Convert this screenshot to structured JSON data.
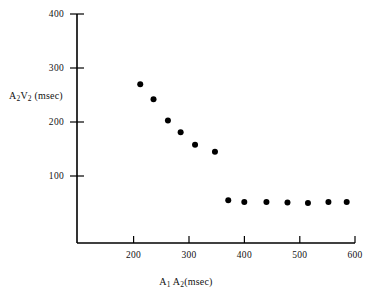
{
  "chart_data": {
    "type": "scatter",
    "title": "",
    "xlabel": "A1 A2(msec)",
    "ylabel": "A2V2 (msec)",
    "xlabel_parts": {
      "a": "A",
      "sub1": "1",
      "b": " A",
      "sub2": "2",
      "unit": "(msec)"
    },
    "ylabel_parts": {
      "a": "A",
      "sub1": "2",
      "b": "V",
      "sub2": "2",
      "unit": " (msec)"
    },
    "xlim": [
      100,
      600
    ],
    "ylim": [
      0,
      400
    ],
    "xticks": [
      200,
      300,
      400,
      500,
      600
    ],
    "yticks": [
      100,
      200,
      300,
      400
    ],
    "grid": false,
    "legend": null,
    "marker": "filled-circle",
    "marker_color": "#000000",
    "marker_size_px": 6,
    "axis_color": "#000000",
    "background_color": "#ffffff",
    "points": [
      {
        "x": 212,
        "y": 270
      },
      {
        "x": 236,
        "y": 242
      },
      {
        "x": 262,
        "y": 203
      },
      {
        "x": 285,
        "y": 181
      },
      {
        "x": 311,
        "y": 158
      },
      {
        "x": 347,
        "y": 145
      },
      {
        "x": 371,
        "y": 55
      },
      {
        "x": 400,
        "y": 52
      },
      {
        "x": 440,
        "y": 52
      },
      {
        "x": 478,
        "y": 51
      },
      {
        "x": 515,
        "y": 50
      },
      {
        "x": 552,
        "y": 52
      },
      {
        "x": 585,
        "y": 52
      }
    ]
  }
}
